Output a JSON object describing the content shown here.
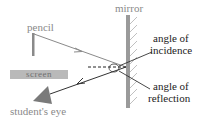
{
  "diagram": {
    "labels": {
      "pencil": "pencil",
      "mirror": "mirror",
      "screen": "screen",
      "eye": "student's eye",
      "incidence_line1": "angle of",
      "incidence_line2": "incidence",
      "reflection_line1": "angle of",
      "reflection_line2": "reflection"
    },
    "colors": {
      "incident_ray": "#8a8a8a",
      "reflected_ray": "#333333",
      "mirror": "#9a9a9a",
      "screen": "#b9b9b9",
      "eye": "#7a7a7a"
    }
  }
}
